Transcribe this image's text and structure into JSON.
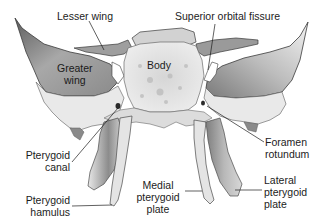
{
  "diagram": {
    "colors": {
      "bone_light": "#e6e6e6",
      "bone_mid": "#b4b4b4",
      "bone_dark": "#6e6e6e",
      "outline": "#3a3a3a",
      "leader_line": "#1c1c1c",
      "label_text": "#1c1c1c",
      "background": "#ffffff"
    },
    "labels": {
      "lesser_wing": [
        "Lesser wing"
      ],
      "superior_orbital_fissure": [
        "Superior orbital fissure"
      ],
      "greater_wing": [
        "Greater",
        "wing"
      ],
      "body": [
        "Body"
      ],
      "foramen_rotundum": [
        "Foramen",
        "rotundum"
      ],
      "pterygoid_canal": [
        "Pterygoid",
        "canal"
      ],
      "pterygoid_hamulus": [
        "Pterygoid",
        "hamulus"
      ],
      "medial_pterygoid_plate": [
        "Medial",
        "pterygoid",
        "plate"
      ],
      "lateral_pterygoid_plate": [
        "Lateral",
        "pterygoid",
        "plate"
      ]
    }
  }
}
